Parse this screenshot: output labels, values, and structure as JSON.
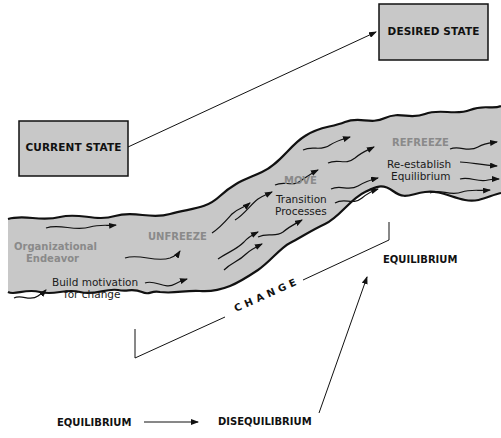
{
  "diagram": {
    "colors": {
      "river_fill": "#c8c8c8",
      "box_fill": "#c8c8c8",
      "outline": "#111111",
      "stage_label": "#8a8a8a"
    },
    "boxes": {
      "current_state": "CURRENT STATE",
      "desired_state": "DESIRED STATE"
    },
    "river": {
      "origin_label_line1": "Organizational",
      "origin_label_line2": "Endeavor",
      "stages": [
        {
          "name": "UNFREEZE",
          "desc_line1": "Build motivation",
          "desc_line2": "for change"
        },
        {
          "name": "MOVE",
          "desc_line1": "Transition",
          "desc_line2": "Processes"
        },
        {
          "name": "REFREEZE",
          "desc_line1": "Re-establish",
          "desc_line2": "Equilibrium"
        }
      ]
    },
    "change_bracket_label": "CHANGE",
    "equilibrium_right": "EQUILIBRIUM",
    "bottom_flow": {
      "start": "EQUILIBRIUM",
      "end": "DISEQUILIBRIUM"
    }
  }
}
